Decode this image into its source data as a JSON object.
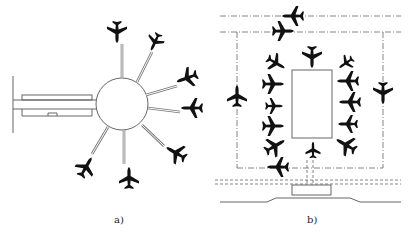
{
  "figure": {
    "panels": [
      {
        "id": "a",
        "caption": "a)",
        "description": "Satellite terminal: circular satellite connected to main terminal by a tunnel/corridor, with aircraft parked radially at the ends of gate bridges",
        "aircraft_count": 8
      },
      {
        "id": "b",
        "caption": "b)",
        "description": "Remote apron / linear satellite: rectangular terminal surrounded by aircraft, with taxi lanes (dash-dot lines) and a connector to the main terminal",
        "aircraft_count": 18
      }
    ],
    "colors": {
      "line": "#555555",
      "aircraft": "#111111",
      "background": "#ffffff"
    }
  }
}
